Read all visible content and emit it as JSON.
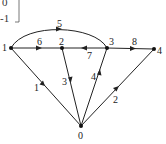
{
  "matrix_fragment": {
    "top_text": "0",
    "bottom_text": "-1"
  },
  "graph": {
    "nodes": [
      {
        "id": "1",
        "x": 11,
        "y": 48
      },
      {
        "id": "2",
        "x": 62,
        "y": 48
      },
      {
        "id": "3",
        "x": 107,
        "y": 48
      },
      {
        "id": "4",
        "x": 154,
        "y": 49
      },
      {
        "id": "0",
        "x": 81,
        "y": 126
      }
    ],
    "edges": [
      {
        "label": "1",
        "from": "1",
        "to": "0"
      },
      {
        "label": "2",
        "from": "0",
        "to": "4"
      },
      {
        "label": "3",
        "from": "2",
        "to": "0"
      },
      {
        "label": "4",
        "from": "0",
        "to": "3"
      },
      {
        "label": "5",
        "from": "1",
        "to": "3",
        "curved": true
      },
      {
        "label": "6",
        "from": "1",
        "to": "2"
      },
      {
        "label": "7",
        "from": "3",
        "to": "2"
      },
      {
        "label": "8",
        "from": "3",
        "to": "4"
      }
    ]
  },
  "colors": {
    "stroke": "#222222",
    "background": "#ffffff"
  }
}
